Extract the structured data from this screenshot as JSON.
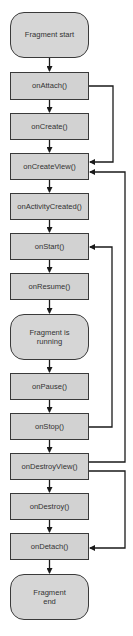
{
  "diagram": {
    "nodes": [
      {
        "id": "start",
        "label": "Fragment start",
        "shape": "rounded"
      },
      {
        "id": "onAttach",
        "label": "onAttach()",
        "shape": "rect"
      },
      {
        "id": "onCreate",
        "label": "onCreate()",
        "shape": "rect"
      },
      {
        "id": "onCreateView",
        "label": "onCreateView()",
        "shape": "rect"
      },
      {
        "id": "onActivityCreated",
        "label": "onActivityCreated()",
        "shape": "rect"
      },
      {
        "id": "onStart",
        "label": "onStart()",
        "shape": "rect"
      },
      {
        "id": "onResume",
        "label": "onResume()",
        "shape": "rect"
      },
      {
        "id": "running",
        "label": "Fragment is running",
        "shape": "rounded"
      },
      {
        "id": "onPause",
        "label": "onPause()",
        "shape": "rect"
      },
      {
        "id": "onStop",
        "label": "onStop()",
        "shape": "rect"
      },
      {
        "id": "onDestroyView",
        "label": "onDestroyView()",
        "shape": "rect"
      },
      {
        "id": "onDestroy",
        "label": "onDestroy()",
        "shape": "rect"
      },
      {
        "id": "onDetach",
        "label": "onDetach()",
        "shape": "rect"
      },
      {
        "id": "end",
        "label": "Fragment end",
        "shape": "rounded"
      }
    ],
    "edges": [
      {
        "from": "start",
        "to": "onAttach"
      },
      {
        "from": "onAttach",
        "to": "onCreate"
      },
      {
        "from": "onAttach",
        "to": "onCreateView",
        "loop": true
      },
      {
        "from": "onCreate",
        "to": "onCreateView"
      },
      {
        "from": "onCreateView",
        "to": "onActivityCreated"
      },
      {
        "from": "onActivityCreated",
        "to": "onStart"
      },
      {
        "from": "onStart",
        "to": "onResume"
      },
      {
        "from": "onResume",
        "to": "running"
      },
      {
        "from": "running",
        "to": "onPause"
      },
      {
        "from": "onPause",
        "to": "onStop"
      },
      {
        "from": "onStop",
        "to": "onStart",
        "loop": true
      },
      {
        "from": "onStop",
        "to": "onDestroyView"
      },
      {
        "from": "onDestroyView",
        "to": "onCreateView",
        "loop": true
      },
      {
        "from": "onDestroyView",
        "to": "onDestroy"
      },
      {
        "from": "onDestroyView",
        "to": "onDetach",
        "loop": true
      },
      {
        "from": "onDestroy",
        "to": "onDetach"
      },
      {
        "from": "onDetach",
        "to": "end"
      }
    ],
    "colors": {
      "fill": "#d2d2d2",
      "stroke": "#3a3a3a",
      "text": "#333333"
    }
  }
}
